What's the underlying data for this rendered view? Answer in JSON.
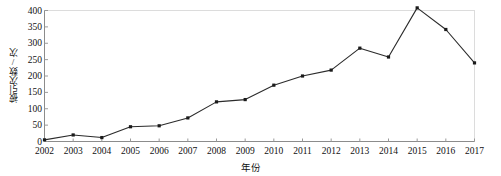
{
  "chart_data": {
    "type": "line",
    "title": "",
    "xlabel": "年份",
    "ylabel": "被引次数/次",
    "categories": [
      "2002",
      "2003",
      "2004",
      "2005",
      "2006",
      "2007",
      "2008",
      "2009",
      "2010",
      "2011",
      "2012",
      "2013",
      "2014",
      "2015",
      "2016",
      "2017"
    ],
    "values": [
      5,
      20,
      12,
      45,
      48,
      72,
      121,
      128,
      172,
      200,
      218,
      285,
      258,
      408,
      342,
      240
    ],
    "x": [
      2002,
      2003,
      2004,
      2005,
      2006,
      2007,
      2008,
      2009,
      2010,
      2011,
      2012,
      2013,
      2014,
      2015,
      2016,
      2017
    ],
    "ylim": [
      0,
      400
    ],
    "xlim": [
      2002,
      2017
    ],
    "yticks": [
      0,
      50,
      100,
      150,
      200,
      250,
      300,
      350,
      400
    ],
    "ytick_labels": [
      "0",
      "50",
      "100",
      "150",
      "200",
      "250",
      "300",
      "350",
      "400"
    ],
    "grid": false,
    "legend": null,
    "series": [
      {
        "name": "被引次数/次",
        "values": [
          5,
          20,
          12,
          45,
          48,
          72,
          121,
          128,
          172,
          200,
          218,
          285,
          258,
          408,
          342,
          240
        ],
        "color": "#2b2b2b",
        "marker": "square",
        "marker_color": "#1a1a1a"
      }
    ],
    "annotations": [],
    "colors": {
      "line": "#2b2b2b",
      "marker": "#1a1a1a",
      "axis": "#9a9a9a",
      "text": "#111111",
      "background": "#ffffff",
      "plot_border": "#d8d8d8"
    }
  }
}
